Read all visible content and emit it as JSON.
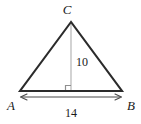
{
  "figure": {
    "shape_type": "triangle",
    "background_color": "#ffffff",
    "stroke_color": "#2b2b2b",
    "altitude_color": "#b0b0b0",
    "dimension_color": "#4a4a4a",
    "vertices": [
      {
        "name": "C",
        "label": "C",
        "x": 71,
        "y": 22,
        "label_x": 67,
        "label_y": 14
      },
      {
        "name": "A",
        "label": "A",
        "x": 20,
        "y": 91,
        "label_x": 7,
        "label_y": 108
      },
      {
        "name": "B",
        "label": "B",
        "x": 122,
        "y": 91,
        "label_x": 126,
        "label_y": 108
      }
    ],
    "altitude": {
      "label": "10",
      "from_x": 71,
      "from_y": 22,
      "to_x": 71,
      "to_y": 91,
      "label_x": 76,
      "label_y": 63,
      "right_angle_marker": true
    },
    "base_dimension": {
      "label": "14",
      "from_x": 20,
      "from_y": 97,
      "to_x": 122,
      "to_y": 97,
      "label_x": 71,
      "label_y": 114
    }
  }
}
